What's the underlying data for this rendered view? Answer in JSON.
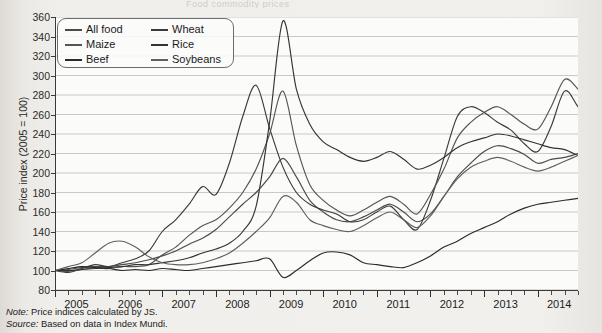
{
  "figure": {
    "title_remnant": "Food commodity prices",
    "note_label": "Note:",
    "note_text": "Price indices calculated by JS.",
    "source_label": "Source:",
    "source_text": "Based on data in Index Mundi."
  },
  "legend": {
    "items": [
      {
        "label": "All food",
        "color": "#4a4a4a"
      },
      {
        "label": "Wheat",
        "color": "#3b3b3b"
      },
      {
        "label": "Maize",
        "color": "#555555"
      },
      {
        "label": "Rice",
        "color": "#343434"
      },
      {
        "label": "Beef",
        "color": "#2b2b2b"
      },
      {
        "label": "Soybeans",
        "color": "#606060"
      }
    ]
  },
  "chart_data": {
    "type": "line",
    "xlabel": "",
    "ylabel": "Price index (2005 = 100)",
    "ylim": [
      80,
      360
    ],
    "ytick_step": 20,
    "yticks": [
      80,
      100,
      120,
      140,
      160,
      180,
      200,
      220,
      240,
      260,
      280,
      300,
      320,
      340,
      360
    ],
    "xlim": [
      2005.0,
      2014.75
    ],
    "xtick_labels": [
      "2005",
      "2006",
      "2007",
      "2008",
      "2009",
      "2010",
      "2011",
      "2012",
      "2013",
      "2014"
    ],
    "xtick_values": [
      2005,
      2006,
      2007,
      2008,
      2009,
      2010,
      2011,
      2012,
      2013,
      2014
    ],
    "minor_tick_interval_months": 3,
    "grid": "horizontal",
    "legend_position": "top-left",
    "x_start": 2005.0,
    "x_step_years": 0.25,
    "series": [
      {
        "name": "All food",
        "color": "#4a4a4a",
        "values": [
          100,
          101,
          103,
          104,
          104,
          106,
          108,
          111,
          115,
          120,
          127,
          133,
          142,
          155,
          168,
          180,
          196,
          215,
          196,
          172,
          160,
          152,
          150,
          155,
          162,
          168,
          160,
          150,
          158,
          176,
          196,
          210,
          222,
          228,
          225,
          219,
          210,
          214,
          216,
          220,
          224,
          222,
          214,
          200,
          196,
          193,
          190,
          196,
          200,
          198,
          195
        ]
      },
      {
        "name": "Wheat",
        "color": "#3b3b3b",
        "values": [
          100,
          98,
          102,
          106,
          104,
          108,
          112,
          120,
          140,
          152,
          168,
          186,
          178,
          210,
          258,
          290,
          246,
          206,
          180,
          168,
          162,
          158,
          150,
          152,
          160,
          166,
          152,
          142,
          172,
          215,
          258,
          268,
          262,
          252,
          244,
          230,
          222,
          248,
          284,
          268,
          250,
          232,
          220,
          206,
          200,
          230,
          262,
          246,
          214,
          190,
          196
        ]
      },
      {
        "name": "Maize",
        "color": "#555555",
        "values": [
          100,
          99,
          101,
          103,
          102,
          104,
          104,
          106,
          116,
          124,
          136,
          146,
          152,
          164,
          180,
          204,
          240,
          284,
          228,
          188,
          172,
          162,
          156,
          162,
          170,
          176,
          168,
          158,
          178,
          204,
          236,
          252,
          262,
          268,
          260,
          250,
          245,
          268,
          296,
          286,
          268,
          248,
          236,
          218,
          206,
          196,
          190,
          188,
          184,
          180,
          178
        ]
      },
      {
        "name": "Rice",
        "color": "#343434",
        "values": [
          100,
          100,
          101,
          102,
          103,
          104,
          106,
          106,
          108,
          110,
          113,
          118,
          122,
          128,
          140,
          166,
          252,
          356,
          286,
          250,
          232,
          224,
          216,
          212,
          216,
          222,
          214,
          204,
          208,
          216,
          226,
          232,
          236,
          240,
          238,
          234,
          230,
          226,
          224,
          218,
          212,
          200,
          190,
          178,
          170,
          164,
          160,
          156,
          150,
          152,
          154
        ]
      },
      {
        "name": "Beef",
        "color": "#2b2b2b",
        "values": [
          100,
          102,
          104,
          103,
          102,
          100,
          101,
          100,
          102,
          101,
          100,
          102,
          104,
          106,
          108,
          110,
          112,
          93,
          100,
          110,
          118,
          119,
          116,
          108,
          106,
          104,
          103,
          108,
          115,
          124,
          130,
          138,
          144,
          150,
          158,
          164,
          168,
          170,
          172,
          174,
          176,
          178,
          176,
          174,
          170,
          172,
          180,
          192,
          200,
          202,
          198
        ]
      },
      {
        "name": "Soybeans",
        "color": "#606060",
        "values": [
          100,
          104,
          108,
          118,
          128,
          130,
          124,
          114,
          108,
          106,
          106,
          108,
          112,
          118,
          128,
          140,
          154,
          176,
          170,
          152,
          146,
          142,
          140,
          146,
          154,
          160,
          152,
          144,
          156,
          176,
          194,
          206,
          212,
          216,
          212,
          206,
          202,
          206,
          212,
          218,
          224,
          220,
          214,
          202,
          196,
          194,
          192,
          196,
          202,
          200,
          196
        ]
      }
    ]
  }
}
